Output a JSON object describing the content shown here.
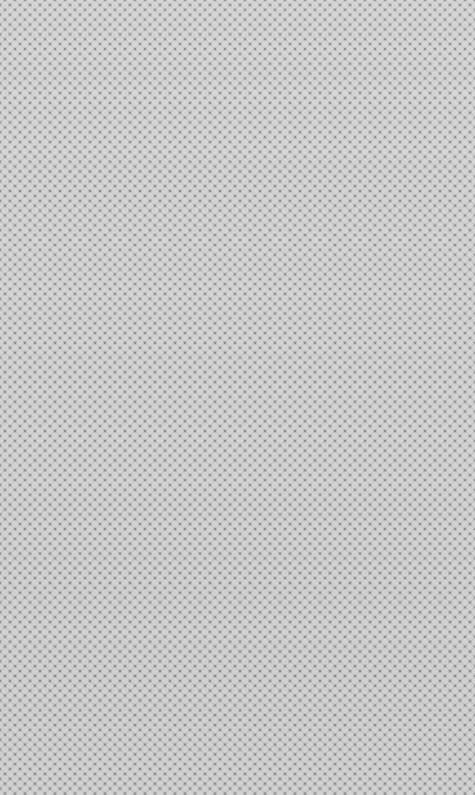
{
  "canvas": {
    "pattern": "diamond-checker",
    "light_color": "#d4d4d4",
    "dark_color": "#8e8e8e",
    "cell_period_px": 10,
    "width": 475,
    "height": 795
  }
}
